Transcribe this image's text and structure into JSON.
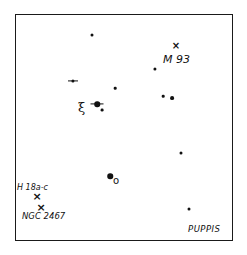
{
  "map": {
    "constellation_label": "PUPPIS",
    "frame": {
      "left": 15,
      "top": 14,
      "right": 233,
      "bottom": 241
    }
  },
  "objects": {
    "m93": {
      "label": "M 93",
      "mark": "×",
      "mark_x": 176,
      "mark_y": 46,
      "label_x": 163,
      "label_y": 54
    },
    "h18": {
      "label": "H 18a-c",
      "mark": "×",
      "mark_x": 37,
      "mark_y": 196,
      "label_x": 17,
      "label_y": 184
    },
    "ngc2467": {
      "label": "NGC 2467",
      "mark": "×",
      "mark_x": 41,
      "mark_y": 207,
      "label_x": 22,
      "label_y": 212
    }
  },
  "greek_labels": {
    "xi": {
      "symbol": "ξ",
      "x": 78,
      "y": 101
    },
    "omicron": {
      "symbol": "o",
      "x": 113,
      "y": 177
    }
  },
  "stars": [
    {
      "id": "s1",
      "x": 92,
      "y": 35,
      "size": 3,
      "bar": 0
    },
    {
      "id": "s2",
      "x": 155,
      "y": 69,
      "size": 3.2,
      "bar": 0
    },
    {
      "id": "s3",
      "x": 73,
      "y": 81,
      "size": 3.2,
      "bar": 10
    },
    {
      "id": "s4",
      "x": 115,
      "y": 88,
      "size": 2.6,
      "bar": 0
    },
    {
      "id": "s5",
      "x": 163,
      "y": 96,
      "size": 2.6,
      "bar": 0
    },
    {
      "id": "s6",
      "x": 172,
      "y": 98,
      "size": 3.8,
      "bar": 0
    },
    {
      "id": "xi-pup",
      "x": 97,
      "y": 104,
      "size": 5.5,
      "bar": 13
    },
    {
      "id": "s8",
      "x": 102,
      "y": 110,
      "size": 2.8,
      "bar": 0
    },
    {
      "id": "s9",
      "x": 181,
      "y": 153,
      "size": 3,
      "bar": 0
    },
    {
      "id": "omicron-pup",
      "x": 110,
      "y": 176,
      "size": 5.5,
      "bar": 0
    },
    {
      "id": "s11",
      "x": 189,
      "y": 209,
      "size": 3,
      "bar": 0
    }
  ]
}
